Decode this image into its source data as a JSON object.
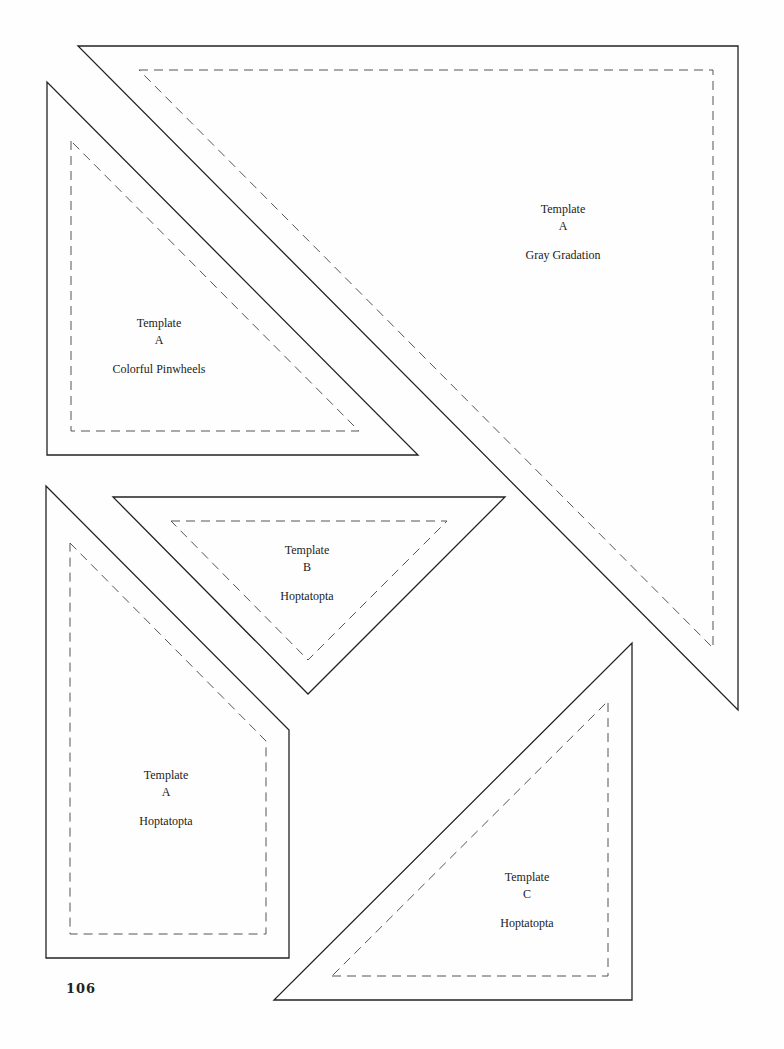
{
  "page": {
    "number": "106"
  },
  "templates": [
    {
      "id": "big-a",
      "title": "Template",
      "letter": "A",
      "name": "Gray Gradation"
    },
    {
      "id": "left-a",
      "title": "Template",
      "letter": "A",
      "name": "Colorful Pinwheels"
    },
    {
      "id": "b",
      "title": "Template",
      "letter": "B",
      "name": "Hoptatopta"
    },
    {
      "id": "pent-a",
      "title": "Template",
      "letter": "A",
      "name": "Hoptatopta"
    },
    {
      "id": "c",
      "title": "Template",
      "letter": "C",
      "name": "Hoptatopta"
    }
  ],
  "colors": {
    "outline": "#222222",
    "seam": "#555555",
    "background": "#fefefe"
  }
}
